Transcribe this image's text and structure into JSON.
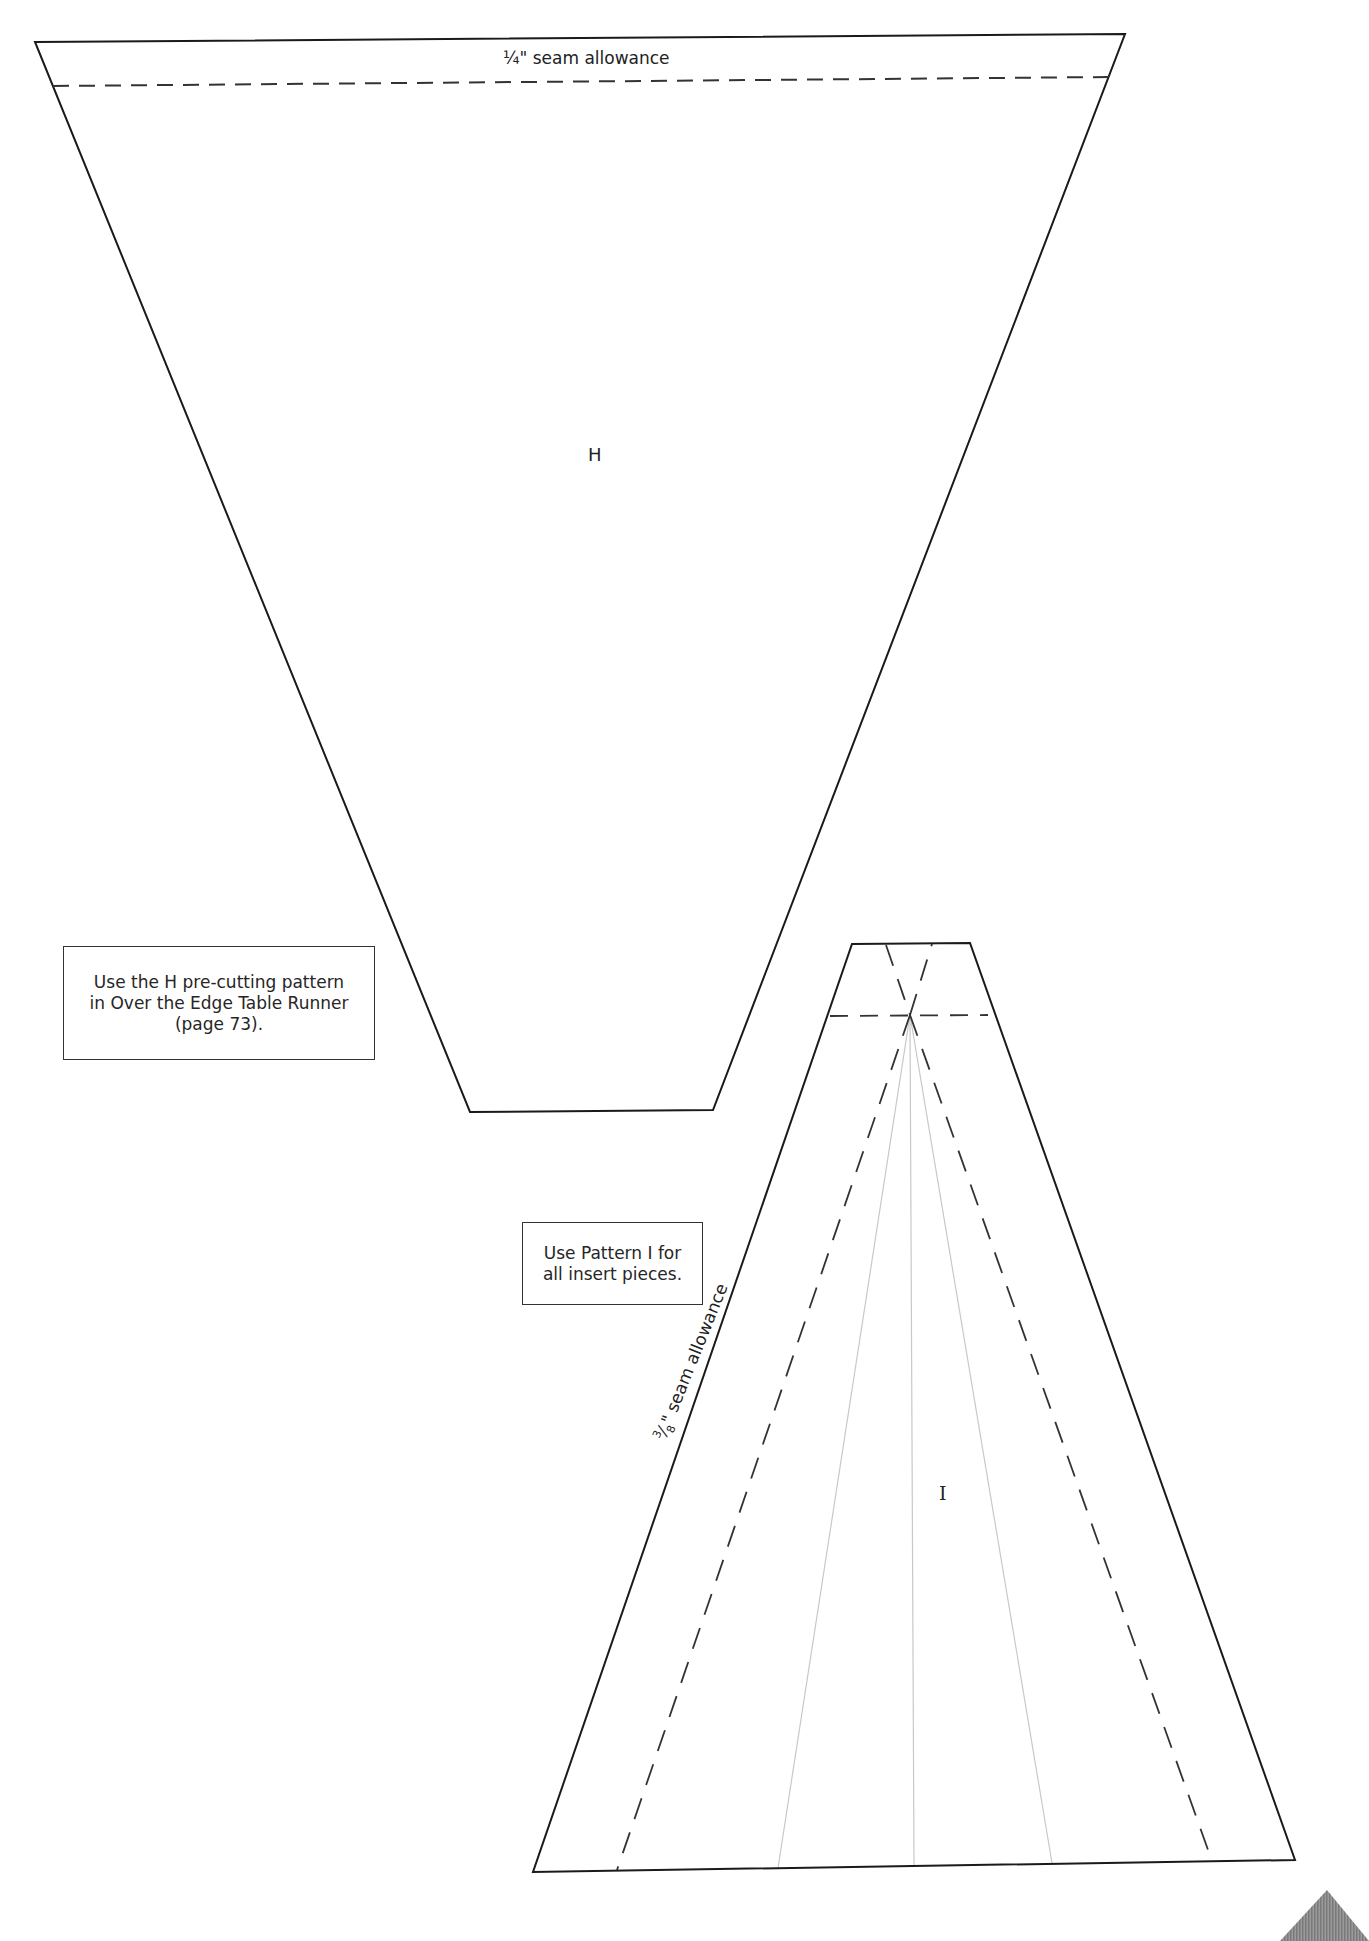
{
  "page": {
    "background": "#ffffff",
    "line_color": "#1a1a1a",
    "dash_color": "#333333",
    "guide_color": "#c8c8c8",
    "corner_color": "#8a8a8a"
  },
  "pattern_h": {
    "letter": "H",
    "seam_label": "¼\" seam allowance",
    "outline_points": "35,42 1125,34 713,1110 470,1112",
    "seam_line": {
      "x1": 53,
      "y1": 86,
      "x2": 1110,
      "y2": 77
    }
  },
  "pattern_i": {
    "letter": "I",
    "seam_label_fraction_num": "3",
    "seam_label_fraction_den": "8",
    "seam_label_text": "\" seam allowance",
    "outline_points": "852,944 970,943 1295,1860 533,1872",
    "top_seam_line": {
      "x1": 830,
      "y1": 1016,
      "x2": 988,
      "y2": 1015
    },
    "dashed_lines": [
      {
        "x1": 886,
        "y1": 945,
        "x2": 910,
        "y2": 1015
      },
      {
        "x1": 910,
        "y1": 1015,
        "x2": 932,
        "y2": 944
      },
      {
        "x1": 910,
        "y1": 1015,
        "x2": 617,
        "y2": 1870
      },
      {
        "x1": 910,
        "y1": 1015,
        "x2": 1212,
        "y2": 1861
      }
    ],
    "guide_lines": [
      {
        "x1": 910,
        "y1": 1015,
        "x2": 778,
        "y2": 1868
      },
      {
        "x1": 910,
        "y1": 1015,
        "x2": 914,
        "y2": 1866
      },
      {
        "x1": 910,
        "y1": 1015,
        "x2": 1052,
        "y2": 1863
      }
    ]
  },
  "notes": {
    "h_note": {
      "lines": [
        "Use the H pre-cutting pattern",
        "in Over the Edge Table Runner",
        "(page 73)."
      ]
    },
    "i_note": {
      "lines": [
        "Use Pattern I for",
        "all insert pieces."
      ]
    }
  },
  "corner_marker": {
    "points": "1280,1941 1327,1890 1369,1941"
  }
}
